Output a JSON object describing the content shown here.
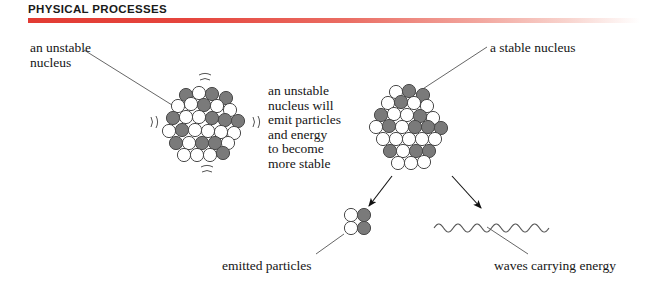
{
  "header": {
    "title": "PHYSICAL PROCESSES",
    "rule_color_start": "#e23b33",
    "rule_color_end": "#ffffff"
  },
  "labels": {
    "unstable_nucleus": "an unstable\nnucleus",
    "stable_nucleus": "a stable nucleus",
    "center_caption": "an unstable\nnucleus will\nemit particles\nand energy\nto become\nmore stable",
    "emitted_particles": "emitted particles",
    "waves_carrying_energy": "waves carrying energy"
  },
  "colors": {
    "nucleon_filled": "#7a7a7a",
    "nucleon_empty": "#ffffff",
    "nucleon_stroke": "#4a4a4a",
    "line": "#555555",
    "arrow": "#111111",
    "text": "#151515"
  },
  "diagram": {
    "type": "nuclear-decay-schematic",
    "nucleon_radius": 6.6,
    "unstable_nucleus": {
      "center": [
        205,
        124
      ],
      "vibration_marks": 4,
      "nucleons": [
        {
          "x": 186,
          "y": 95,
          "filled": true
        },
        {
          "x": 199,
          "y": 93,
          "filled": false
        },
        {
          "x": 212,
          "y": 94,
          "filled": true
        },
        {
          "x": 226,
          "y": 98,
          "filled": true
        },
        {
          "x": 178,
          "y": 106,
          "filled": false
        },
        {
          "x": 191,
          "y": 104,
          "filled": false
        },
        {
          "x": 204,
          "y": 105,
          "filled": true
        },
        {
          "x": 217,
          "y": 106,
          "filled": false
        },
        {
          "x": 230,
          "y": 110,
          "filled": false
        },
        {
          "x": 173,
          "y": 118,
          "filled": true
        },
        {
          "x": 186,
          "y": 117,
          "filled": false
        },
        {
          "x": 199,
          "y": 117,
          "filled": false
        },
        {
          "x": 212,
          "y": 118,
          "filled": true
        },
        {
          "x": 225,
          "y": 120,
          "filled": true
        },
        {
          "x": 238,
          "y": 121,
          "filled": true
        },
        {
          "x": 169,
          "y": 131,
          "filled": false
        },
        {
          "x": 182,
          "y": 130,
          "filled": true
        },
        {
          "x": 195,
          "y": 130,
          "filled": false
        },
        {
          "x": 208,
          "y": 131,
          "filled": false
        },
        {
          "x": 221,
          "y": 132,
          "filled": false
        },
        {
          "x": 234,
          "y": 133,
          "filled": false
        },
        {
          "x": 176,
          "y": 143,
          "filled": true
        },
        {
          "x": 189,
          "y": 143,
          "filled": false
        },
        {
          "x": 202,
          "y": 143,
          "filled": true
        },
        {
          "x": 215,
          "y": 143,
          "filled": true
        },
        {
          "x": 228,
          "y": 143,
          "filled": false
        },
        {
          "x": 184,
          "y": 155,
          "filled": false
        },
        {
          "x": 197,
          "y": 155,
          "filled": false
        },
        {
          "x": 210,
          "y": 155,
          "filled": false
        },
        {
          "x": 223,
          "y": 153,
          "filled": true
        }
      ]
    },
    "stable_nucleus": {
      "center": [
        412,
        124
      ],
      "nucleons": [
        {
          "x": 396,
          "y": 92,
          "filled": false
        },
        {
          "x": 409,
          "y": 91,
          "filled": true
        },
        {
          "x": 423,
          "y": 95,
          "filled": true
        },
        {
          "x": 388,
          "y": 103,
          "filled": false
        },
        {
          "x": 401,
          "y": 102,
          "filled": true
        },
        {
          "x": 414,
          "y": 103,
          "filled": false
        },
        {
          "x": 427,
          "y": 106,
          "filled": false
        },
        {
          "x": 381,
          "y": 115,
          "filled": true
        },
        {
          "x": 394,
          "y": 114,
          "filled": false
        },
        {
          "x": 407,
          "y": 115,
          "filled": false
        },
        {
          "x": 420,
          "y": 116,
          "filled": true
        },
        {
          "x": 433,
          "y": 118,
          "filled": false
        },
        {
          "x": 376,
          "y": 127,
          "filled": false
        },
        {
          "x": 389,
          "y": 126,
          "filled": true
        },
        {
          "x": 402,
          "y": 127,
          "filled": false
        },
        {
          "x": 415,
          "y": 127,
          "filled": true
        },
        {
          "x": 428,
          "y": 127,
          "filled": true
        },
        {
          "x": 441,
          "y": 128,
          "filled": true
        },
        {
          "x": 383,
          "y": 139,
          "filled": false
        },
        {
          "x": 396,
          "y": 139,
          "filled": false
        },
        {
          "x": 409,
          "y": 139,
          "filled": false
        },
        {
          "x": 422,
          "y": 139,
          "filled": false
        },
        {
          "x": 435,
          "y": 139,
          "filled": false
        },
        {
          "x": 390,
          "y": 151,
          "filled": true
        },
        {
          "x": 403,
          "y": 151,
          "filled": false
        },
        {
          "x": 416,
          "y": 151,
          "filled": true
        },
        {
          "x": 429,
          "y": 151,
          "filled": true
        },
        {
          "x": 398,
          "y": 163,
          "filled": false
        },
        {
          "x": 411,
          "y": 163,
          "filled": false
        },
        {
          "x": 424,
          "y": 162,
          "filled": false
        }
      ]
    },
    "emitted_particles": {
      "nucleons": [
        {
          "x": 351,
          "y": 215,
          "filled": false
        },
        {
          "x": 364,
          "y": 215,
          "filled": true
        },
        {
          "x": 351,
          "y": 228,
          "filled": false
        },
        {
          "x": 364,
          "y": 228,
          "filled": true
        }
      ]
    },
    "wave": {
      "x_start": 434,
      "x_end": 549,
      "y": 228,
      "cycles": 6,
      "amplitude": 4
    },
    "leader_lines": [
      {
        "name": "unstable-label-to-nucleus",
        "from": [
          84,
          50
        ],
        "to": [
          180,
          110
        ]
      },
      {
        "name": "stable-label-to-nucleus",
        "from": [
          487,
          47
        ],
        "to": [
          412,
          96
        ]
      },
      {
        "name": "emitted-label-to-particles",
        "from": [
          316,
          254
        ],
        "to": [
          344,
          234
        ]
      },
      {
        "name": "waves-label-to-wave",
        "from": [
          528,
          254
        ],
        "to": [
          487,
          227
        ]
      }
    ],
    "arrows": [
      {
        "name": "arrow-to-emitted-particles",
        "from": [
          392,
          176
        ],
        "to": [
          369,
          206
        ]
      },
      {
        "name": "arrow-to-waves",
        "from": [
          452,
          176
        ],
        "to": [
          481,
          208
        ]
      }
    ]
  }
}
